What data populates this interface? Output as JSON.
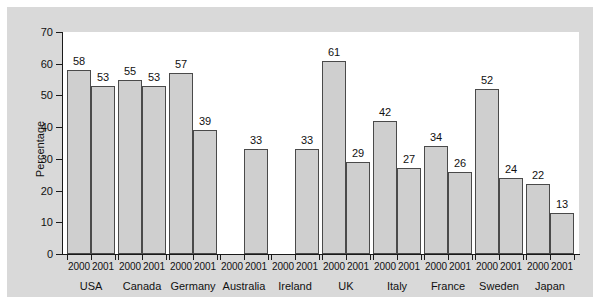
{
  "chart_data": {
    "type": "bar",
    "title": "",
    "xlabel": "",
    "ylabel": "Percentage",
    "ylim": [
      0,
      70
    ],
    "yticks": [
      0,
      10,
      20,
      30,
      40,
      50,
      60,
      70
    ],
    "grid": false,
    "legend": null,
    "categories": [
      "USA",
      "Canada",
      "Germany",
      "Australia",
      "Ireland",
      "UK",
      "Italy",
      "France",
      "Sweden",
      "Japan"
    ],
    "subcategories": [
      "2000",
      "2001"
    ],
    "series": [
      {
        "name": "2000",
        "values": [
          58,
          55,
          57,
          null,
          null,
          61,
          42,
          34,
          52,
          22
        ]
      },
      {
        "name": "2001",
        "values": [
          53,
          53,
          39,
          33,
          33,
          29,
          27,
          26,
          24,
          13
        ]
      }
    ],
    "groups": [
      {
        "country": "USA",
        "bars": [
          {
            "year": "2000",
            "value": 58
          },
          {
            "year": "2001",
            "value": 53
          }
        ]
      },
      {
        "country": "Canada",
        "bars": [
          {
            "year": "2000",
            "value": 55
          },
          {
            "year": "2001",
            "value": 53
          }
        ]
      },
      {
        "country": "Germany",
        "bars": [
          {
            "year": "2000",
            "value": 57
          },
          {
            "year": "2001",
            "value": 39
          }
        ]
      },
      {
        "country": "Australia",
        "bars": [
          {
            "year": "2000",
            "value": null
          },
          {
            "year": "2001",
            "value": 33
          }
        ]
      },
      {
        "country": "Ireland",
        "bars": [
          {
            "year": "2000",
            "value": null
          },
          {
            "year": "2001",
            "value": 33
          }
        ]
      },
      {
        "country": "UK",
        "bars": [
          {
            "year": "2000",
            "value": 61
          },
          {
            "year": "2001",
            "value": 29
          }
        ]
      },
      {
        "country": "Italy",
        "bars": [
          {
            "year": "2000",
            "value": 42
          },
          {
            "year": "2001",
            "value": 27
          }
        ]
      },
      {
        "country": "France",
        "bars": [
          {
            "year": "2000",
            "value": 34
          },
          {
            "year": "2001",
            "value": 26
          }
        ]
      },
      {
        "country": "Sweden",
        "bars": [
          {
            "year": "2000",
            "value": 52
          },
          {
            "year": "2001",
            "value": 24
          }
        ]
      },
      {
        "country": "Japan",
        "bars": [
          {
            "year": "2000",
            "value": 22
          },
          {
            "year": "2001",
            "value": 13
          }
        ]
      }
    ]
  },
  "colors": {
    "page_background": "#ffffff",
    "panel_background": "#d9d9d9",
    "plot_background": "#ffffff",
    "bar_fill": "#cfcfcf",
    "bar_stroke": "#4a4a4a",
    "axis": "#1a1a1a",
    "text": "#111111"
  }
}
